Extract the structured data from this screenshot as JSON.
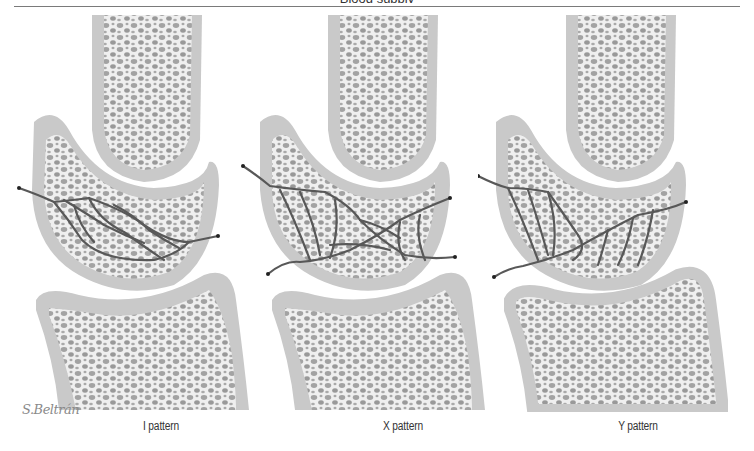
{
  "figure": {
    "title_partial": "Blood supply",
    "signature": "S.Beltrán",
    "colors": {
      "cortex": "#c9c9c9",
      "trabecular_bg": "#efefef",
      "pores": "#9a9a9a",
      "vessel": "#5a5a5a",
      "rule": "#7a7a7a"
    },
    "panels": [
      {
        "id": "i",
        "caption": "I pattern",
        "vessel_pattern": "I"
      },
      {
        "id": "x",
        "caption": "X pattern",
        "vessel_pattern": "X"
      },
      {
        "id": "y",
        "caption": "Y pattern",
        "vessel_pattern": "Y"
      }
    ]
  }
}
